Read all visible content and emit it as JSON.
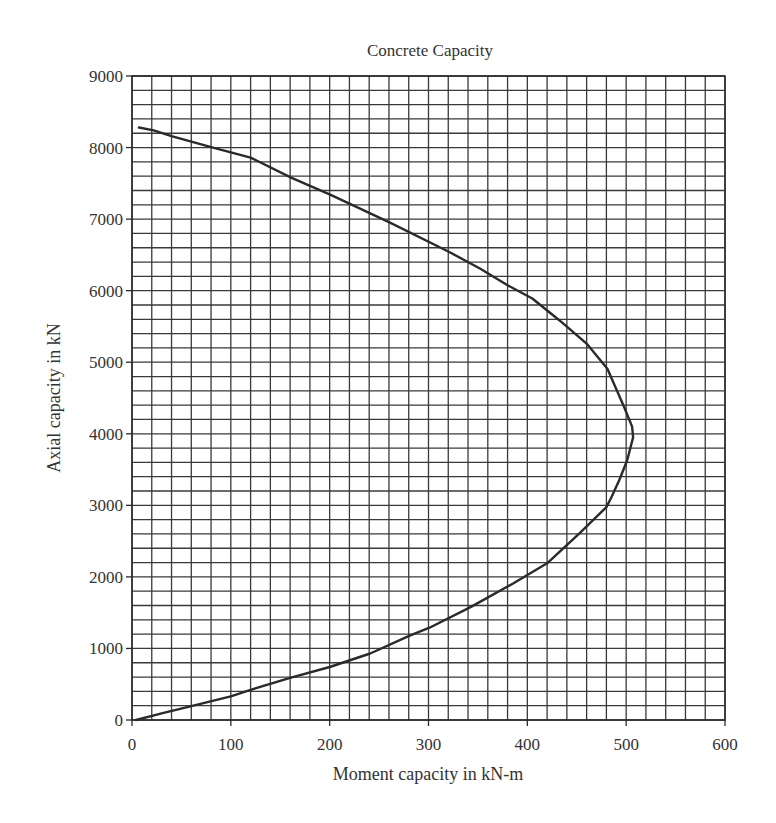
{
  "chart_data": {
    "type": "line",
    "title": "Concrete Capacity",
    "xlabel": "Moment capacity in kN-m",
    "ylabel": "Axial capacity in kN",
    "xlim": [
      0,
      600
    ],
    "ylim": [
      0,
      9000
    ],
    "x_ticks": [
      0,
      100,
      200,
      300,
      400,
      500,
      600
    ],
    "y_ticks": [
      0,
      1000,
      2000,
      3000,
      4000,
      5000,
      6000,
      7000,
      8000,
      9000
    ],
    "x_tick_labels": [
      "0",
      "100",
      "200",
      "300",
      "400",
      "500",
      "600"
    ],
    "y_tick_labels": [
      "0",
      "1000",
      "2000",
      "3000",
      "4000",
      "5000",
      "6000",
      "7000",
      "8000",
      "9000"
    ],
    "grid": true,
    "x_minor_step": 20,
    "y_minor_step": 200,
    "legend": null,
    "series": [
      {
        "name": "Interaction curve",
        "color": "#2a2a2a",
        "x": [
          7,
          22,
          40,
          82,
          120,
          161,
          201,
          261,
          321,
          352,
          380,
          405,
          433,
          460,
          481,
          498,
          506,
          507,
          501,
          493,
          485,
          480,
          453,
          420,
          386,
          343,
          301,
          281,
          241,
          200,
          160,
          120,
          100,
          59,
          32,
          4
        ],
        "y": [
          8280,
          8240,
          8160,
          8000,
          7860,
          7580,
          7340,
          6950,
          6540,
          6310,
          6075,
          5890,
          5580,
          5260,
          4910,
          4370,
          4100,
          3950,
          3630,
          3350,
          3110,
          2975,
          2610,
          2190,
          1910,
          1580,
          1290,
          1180,
          930,
          740,
          590,
          420,
          330,
          190,
          100,
          0
        ]
      }
    ]
  }
}
